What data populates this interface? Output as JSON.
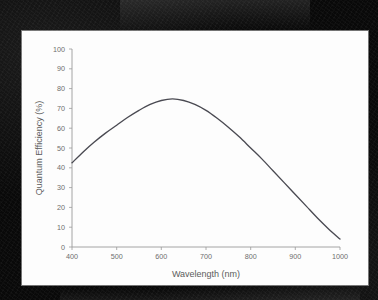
{
  "background": {
    "surround_color": "#090909",
    "card_color": "#fdfdfd"
  },
  "chart_data": {
    "type": "line",
    "title": "",
    "subtitle": "",
    "xlabel": "Wavelength (nm)",
    "ylabel": "Quantum Efficiency (%)",
    "xlim": [
      400,
      1000
    ],
    "ylim": [
      0,
      100
    ],
    "xticks": [
      400,
      500,
      600,
      700,
      800,
      900,
      1000
    ],
    "yticks": [
      0,
      10,
      20,
      30,
      40,
      50,
      60,
      70,
      80,
      90,
      100
    ],
    "xtick_labels": [
      "400",
      "500",
      "600",
      "700",
      "800",
      "900",
      "1000"
    ],
    "ytick_labels": [
      "0",
      "10",
      "20",
      "30",
      "40",
      "50",
      "60",
      "70",
      "80",
      "90",
      "100"
    ],
    "grid": false,
    "legend": null,
    "legend_position": "none",
    "line_color": "#4a4a52",
    "series": [
      {
        "name": "Quantum Efficiency",
        "x": [
          400,
          425,
          450,
          475,
          500,
          525,
          550,
          575,
          600,
          625,
          650,
          675,
          700,
          725,
          750,
          775,
          800,
          825,
          850,
          875,
          900,
          925,
          950,
          975,
          1000
        ],
        "values": [
          42.5,
          48.0,
          53.0,
          57.5,
          61.5,
          65.5,
          69.0,
          72.0,
          74.0,
          74.8,
          74.0,
          72.0,
          69.0,
          65.0,
          60.5,
          55.5,
          50.0,
          44.5,
          38.5,
          32.5,
          26.5,
          20.5,
          14.5,
          9.0,
          4.0
        ]
      }
    ],
    "annotations": []
  },
  "axes": {
    "x_axis_name": "wavelength-axis",
    "y_axis_name": "quantum-efficiency-axis"
  }
}
